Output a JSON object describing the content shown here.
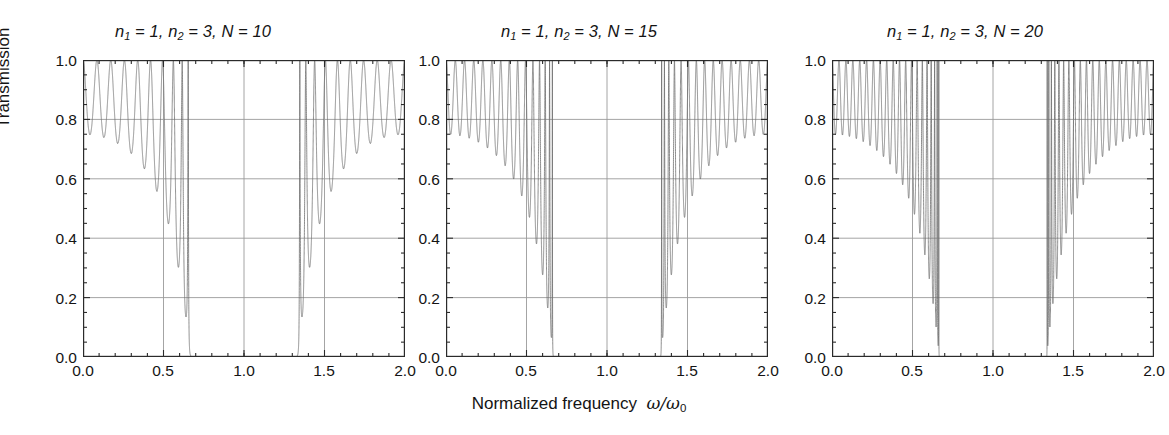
{
  "figure": {
    "xaxis_title_text": "Normalized frequency",
    "xaxis_title_symbol": "ω/ω",
    "xaxis_title_symbol_sub": "0",
    "yaxis_title": "Transmission"
  },
  "panels": [
    {
      "id": "panel-n10",
      "title_prefix": "n",
      "title": "n₁ = 1, n₂ = 3, N = 10",
      "title_parts": {
        "n1": "n",
        "n1sub": "1",
        "eq1": " = 1, ",
        "n2": "n",
        "n2sub": "2",
        "eq2": " = 3, ",
        "N": "N = 10"
      }
    },
    {
      "id": "panel-n15",
      "title": "n₁ = 1, n₂ = 3, N = 15",
      "title_parts": {
        "n1": "n",
        "n1sub": "1",
        "eq1": " = 1, ",
        "n2": "n",
        "n2sub": "2",
        "eq2": " = 3, ",
        "N": "N = 15"
      }
    },
    {
      "id": "panel-n20",
      "title": "n₁ = 1, n₂ = 3, N = 20",
      "title_parts": {
        "n1": "n",
        "n1sub": "1",
        "eq1": " = 1, ",
        "n2": "n",
        "n2sub": "2",
        "eq2": " = 3, ",
        "N": "N = 20"
      }
    }
  ],
  "ticks": {
    "y": [
      "1.0",
      "0.8",
      "0.6",
      "0.4",
      "0.2",
      "0.0"
    ],
    "x": [
      "0.0",
      "0.5",
      "1.0",
      "1.5",
      "2.0"
    ]
  },
  "colors": {
    "curve": "#6e6e6e",
    "axis": "#2b2b2b",
    "grid": "#9a9a9a",
    "text": "#141414",
    "background": "#ffffff"
  },
  "chart_data": {
    "type": "line",
    "n_subplots": 3,
    "xlabel": "Normalized frequency ω/ω₀",
    "ylabel": "Transmission",
    "xlim": [
      0.0,
      2.0
    ],
    "ylim": [
      0.0,
      1.0
    ],
    "xticks": [
      0.0,
      0.5,
      1.0,
      1.5,
      2.0
    ],
    "yticks": [
      0.0,
      0.2,
      0.4,
      0.6,
      0.8,
      1.0
    ],
    "grid": true,
    "grid_x": [
      0.5,
      1.0,
      1.5
    ],
    "grid_y": [
      0.2,
      0.4,
      0.6,
      0.8
    ],
    "legend": null,
    "model": {
      "description": "Transfer-matrix transmittance of an N-period quarter-wave stack, indices n1=1 and n2=3, normal incidence, symmetric about w/w0 = 1",
      "n1": 1,
      "n2": 3,
      "stopband": [
        0.65,
        1.35
      ],
      "stopband_center": 1.0,
      "envelope_min_at_band_edge": 0.0,
      "max_transmission": 1.0
    },
    "subplots": [
      {
        "name": "N = 10",
        "N": 10,
        "n1": 1,
        "n2": 3,
        "title": "n1 = 1, n2 = 3, N = 10",
        "side_lobe_count_per_side": 9,
        "ripple_minima_left": [
          0.775,
          0.772,
          0.767,
          0.757,
          0.742,
          0.715,
          0.66,
          0.555,
          0.32,
          0.02
        ],
        "ripple_minima_x_left": [
          0.05,
          0.14,
          0.23,
          0.31,
          0.39,
          0.46,
          0.525,
          0.575,
          0.615,
          0.645
        ],
        "notes": "Transmission = 1 at each resonance maximum; minima deepen toward the band edge at 0.65; T ~ 0 inside the gap 0.65-1.35; mirror-symmetric lobes for 1.35-2.0"
      },
      {
        "name": "N = 15",
        "N": 15,
        "n1": 1,
        "n2": 3,
        "title": "n1 = 1, n2 = 3, N = 15",
        "side_lobe_count_per_side": 14,
        "ripple_minima_left": [
          0.755,
          0.753,
          0.75,
          0.746,
          0.74,
          0.73,
          0.716,
          0.695,
          0.662,
          0.605,
          0.545,
          0.45,
          0.38,
          0.28,
          0.16,
          0.05
        ],
        "notes": "Narrower, more numerous ripples than N = 10; deeper minima approaching the band edge; T ~ 0 across the 0.65-1.35 gap"
      },
      {
        "name": "N = 20",
        "N": 20,
        "n1": 1,
        "n2": 3,
        "title": "n1 = 1, n2 = 3, N = 20",
        "side_lobe_count_per_side": 19,
        "ripple_minima_left": [
          0.748,
          0.747,
          0.745,
          0.743,
          0.74,
          0.735,
          0.73,
          0.722,
          0.712,
          0.698,
          0.68,
          0.655,
          0.62,
          0.575,
          0.52,
          0.45,
          0.37,
          0.28,
          0.19,
          0.08
        ],
        "notes": "Densest ripple structure; sharpest band edges at 0.65 and 1.35; flat-zero stopband"
      }
    ]
  }
}
